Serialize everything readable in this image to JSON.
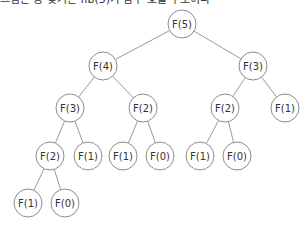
{
  "caption": "그림은 동 찾기는 fib(5)가 함수 호출 구조이다",
  "colors": {
    "edge": "#9a9a9a",
    "node_stroke": "#8c8c8c",
    "node_fill": "#ffffff",
    "text": "#333333"
  },
  "tree": {
    "radius": 14,
    "nodes": [
      {
        "id": "n0",
        "label": "F(5)",
        "x": 182,
        "y": 24
      },
      {
        "id": "n1",
        "label": "F(4)",
        "x": 103,
        "y": 66
      },
      {
        "id": "n2",
        "label": "F(3)",
        "x": 253,
        "y": 66
      },
      {
        "id": "n3",
        "label": "F(3)",
        "x": 70,
        "y": 108
      },
      {
        "id": "n4",
        "label": "F(2)",
        "x": 143,
        "y": 108
      },
      {
        "id": "n5",
        "label": "F(2)",
        "x": 225,
        "y": 108
      },
      {
        "id": "n6",
        "label": "F(1)",
        "x": 285,
        "y": 108
      },
      {
        "id": "n7",
        "label": "F(2)",
        "x": 50,
        "y": 156
      },
      {
        "id": "n8",
        "label": "F(1)",
        "x": 88,
        "y": 156
      },
      {
        "id": "n9",
        "label": "F(1)",
        "x": 123,
        "y": 156
      },
      {
        "id": "n10",
        "label": "F(0)",
        "x": 160,
        "y": 156
      },
      {
        "id": "n11",
        "label": "F(1)",
        "x": 200,
        "y": 156
      },
      {
        "id": "n12",
        "label": "F(0)",
        "x": 237,
        "y": 156
      },
      {
        "id": "n13",
        "label": "F(1)",
        "x": 28,
        "y": 203
      },
      {
        "id": "n14",
        "label": "F(0)",
        "x": 65,
        "y": 203
      }
    ],
    "edges": [
      [
        "n0",
        "n1"
      ],
      [
        "n0",
        "n2"
      ],
      [
        "n1",
        "n3"
      ],
      [
        "n1",
        "n4"
      ],
      [
        "n2",
        "n5"
      ],
      [
        "n2",
        "n6"
      ],
      [
        "n3",
        "n7"
      ],
      [
        "n3",
        "n8"
      ],
      [
        "n4",
        "n9"
      ],
      [
        "n4",
        "n10"
      ],
      [
        "n5",
        "n11"
      ],
      [
        "n5",
        "n12"
      ],
      [
        "n7",
        "n13"
      ],
      [
        "n7",
        "n14"
      ]
    ]
  }
}
